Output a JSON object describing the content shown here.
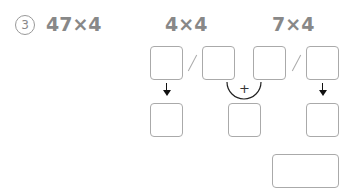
{
  "problem": {
    "number": "3",
    "expression": "47×4",
    "partial_left": "4×4",
    "partial_right": "7×4",
    "operator": "+"
  },
  "answer_boxes": {
    "top_row": [
      "",
      "",
      "",
      ""
    ],
    "middle_row": [
      "",
      "",
      ""
    ],
    "final": ""
  }
}
